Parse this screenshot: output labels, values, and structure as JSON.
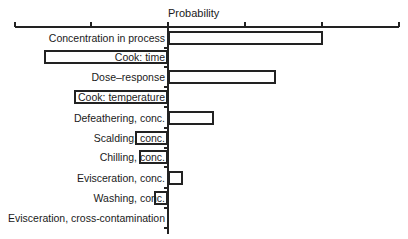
{
  "chart_data": {
    "type": "bar",
    "subtype": "tornado",
    "title": "Probability",
    "xlabel": "Probability",
    "ylabel": "",
    "axis_ticks_px": [
      15,
      91,
      168,
      245,
      322,
      399
    ],
    "center_px": 168,
    "categories": [
      "Concentration in process",
      "Cook: time",
      "Dose–response",
      "Cook: temperature",
      "Defeathering, conc.",
      "Scalding, conc.",
      "Chilling, conc.",
      "Evisceration, conc.",
      "Washing, conc.",
      "Evisceration, cross-contamination"
    ],
    "values": [
      1.0,
      -0.8,
      0.7,
      -0.6,
      0.3,
      -0.19,
      -0.18,
      0.09,
      -0.08,
      0.0
    ],
    "xlim": [
      -1,
      1.5
    ],
    "grid": false,
    "legend": null
  },
  "rows": [
    {
      "label": "Concentration in process",
      "left": 168,
      "width": 155,
      "top": 31
    },
    {
      "label": "Cook: time",
      "left": 44,
      "width": 124,
      "top": 50
    },
    {
      "label": "Dose–response",
      "left": 168,
      "width": 108,
      "top": 70
    },
    {
      "label": "Cook: temperature",
      "left": 74,
      "width": 94,
      "top": 90
    },
    {
      "label": "Defeathering, conc.",
      "left": 168,
      "width": 46,
      "top": 111
    },
    {
      "label": "Scalding, conc.",
      "left": 135,
      "width": 33,
      "top": 131
    },
    {
      "label": "Chilling, conc.",
      "left": 139,
      "width": 29,
      "top": 150
    },
    {
      "label": "Evisceration, conc.",
      "left": 168,
      "width": 15,
      "top": 171
    },
    {
      "label": "Washing, conc.",
      "left": 154,
      "width": 14,
      "top": 191
    },
    {
      "label": "Evisceration, cross-contamination",
      "left": 168,
      "width": 0,
      "top": 211
    }
  ]
}
